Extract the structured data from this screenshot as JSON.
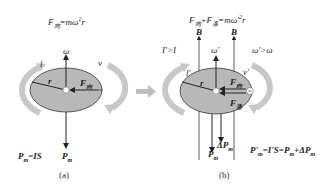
{
  "panel_a": {
    "formula_top": "F",
    "formula_top_sub": "向",
    "formula_top_rest": "=mω",
    "formula_top_sup": "2",
    "formula_top_end": "r",
    "omega": "ω",
    "l": "l",
    "v": "v",
    "r": "r",
    "force": "F",
    "force_sub": "向",
    "pm_eq": "P",
    "pm_eq_sub": "m",
    "pm_eq_rest": "=IS",
    "pm": "P",
    "pm_sub": "m",
    "caption": "(a)"
  },
  "panel_b": {
    "formula_top": "F",
    "formula_top_sub1": "向",
    "formula_top_plus": "+F",
    "formula_top_sub2": "洛",
    "formula_top_rest": "=mω'",
    "formula_top_sup": "2",
    "formula_top_end": "r",
    "b1": "B",
    "b2": "B",
    "omega": "ω'",
    "i_gt": "I'>I",
    "omega_gt": "ω'>ω",
    "l": "l'",
    "v": "v'",
    "r": "r",
    "force1": "F",
    "force1_sub": "向",
    "force2": "F",
    "force2_sub": "洛",
    "delta_p": "ΔP",
    "delta_p_sub": "m",
    "pm": "P",
    "pm_sub": "m",
    "pm_eq": "P'",
    "pm_eq_sub": "m",
    "pm_eq_rest": "=I'S=P",
    "pm_eq_sub2": "m",
    "pm_eq_rest2": "+ΔP",
    "pm_eq_sub3": "m",
    "caption": "(b)"
  },
  "colors": {
    "disk": "#b8b8b8",
    "rotation_arrow": "#c8c8c8",
    "transition_arrow": "#bdbdbd",
    "ink": "#222222"
  }
}
